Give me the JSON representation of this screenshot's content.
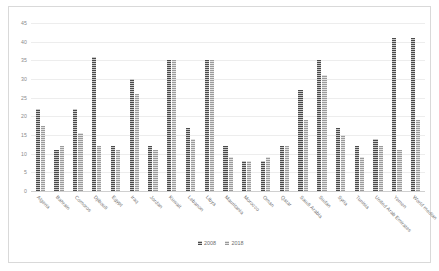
{
  "chart_data": {
    "type": "bar",
    "title": "",
    "subtitle": "",
    "xlabel": "",
    "ylabel": "",
    "ylim": [
      0,
      45
    ],
    "ytick_step": 5,
    "yticks": [
      "0",
      "5",
      "10",
      "15",
      "20",
      "25",
      "30",
      "35",
      "40",
      "45"
    ],
    "grid": true,
    "legend_position": "bottom",
    "categories": [
      "Algeria",
      "Bahrain",
      "Comoros",
      "Djibouti",
      "Egypt",
      "Iraq",
      "Jordan",
      "Kuwait",
      "Lebanon",
      "Libya",
      "Mauritania",
      "Morocco",
      "Oman",
      "Qatar",
      "Saudi Arabia",
      "Sudan",
      "Syria",
      "Tunisia",
      "United Arab Emirates",
      "Yemen",
      "World median"
    ],
    "series": [
      {
        "name": "2008",
        "color": "#4a4a4a",
        "values": [
          22,
          11,
          22,
          36,
          12,
          30,
          12,
          35,
          17,
          35,
          12,
          8,
          8,
          12,
          27,
          35,
          17,
          12,
          14,
          41,
          41
        ]
      },
      {
        "name": "2018",
        "color": "#9a9a9a",
        "values": [
          17.5,
          12,
          15.5,
          12,
          11,
          26,
          11,
          35,
          14,
          35,
          9,
          8,
          9,
          12,
          19,
          31,
          15,
          9,
          12,
          11,
          19
        ]
      }
    ]
  }
}
